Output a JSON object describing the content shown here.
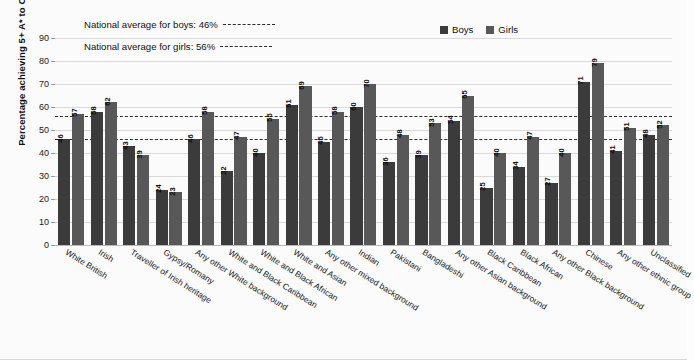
{
  "chart_data": {
    "type": "bar",
    "title": "",
    "xlabel": "",
    "ylabel": "Percentage achieving 5+ A* to C GCSEs",
    "ylim": [
      0,
      90
    ],
    "ytick_step": 10,
    "yticks": [
      0,
      10,
      20,
      30,
      40,
      50,
      60,
      70,
      80,
      90
    ],
    "grid": true,
    "legend_position": "top-right",
    "categories": [
      "White British",
      "Irish",
      "Traveller of Irish heritage",
      "Gypsy/Romany",
      "Any other White background",
      "White and Black Caribbean",
      "White and Black African",
      "White and Asian",
      "Any other mixed background",
      "Indian",
      "Pakistani",
      "Bangladeshi",
      "Any other Asian background",
      "Black Caribbean",
      "Black African",
      "Any other Black background",
      "Chinese",
      "Any other ethnic group",
      "Unclassified"
    ],
    "series": [
      {
        "name": "Boys",
        "color": "#3b3b3b",
        "values": [
          46,
          58,
          43,
          24,
          46,
          32,
          40,
          61,
          45,
          60,
          36,
          39,
          54,
          25,
          34,
          27,
          71,
          41,
          48
        ]
      },
      {
        "name": "Girls",
        "color": "#585858",
        "values": [
          57,
          62,
          39,
          23,
          58,
          47,
          55,
          69,
          58,
          70,
          48,
          53,
          65,
          40,
          47,
          40,
          79,
          51,
          52
        ]
      }
    ],
    "reference_lines": [
      {
        "id": "boys-average",
        "label": "National average for boys: 46%",
        "value": 46
      },
      {
        "id": "girls-average",
        "label": "National average for girls: 56%",
        "value": 56
      }
    ]
  }
}
